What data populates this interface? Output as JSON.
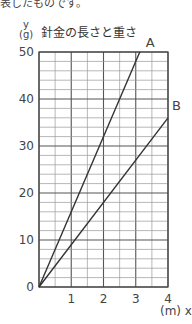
{
  "page": {
    "cut_text": "表したものです。"
  },
  "chart_data": {
    "type": "line",
    "title": "針金の長さと重さ",
    "xlabel": "(m) x",
    "ylabel": "y (g)",
    "ylabel_var": "y",
    "ylabel_unit": "(g)",
    "x_unit": "(m)",
    "x_var": "x",
    "xlim": [
      0,
      4
    ],
    "ylim": [
      0,
      50
    ],
    "x_ticks": [
      "0",
      "1",
      "2",
      "3",
      "4"
    ],
    "y_ticks": [
      "0",
      "10",
      "20",
      "30",
      "40",
      "50"
    ],
    "grid": true,
    "x_minor_step": 0.5,
    "y_minor_step": 2,
    "series": [
      {
        "name": "A",
        "x": [
          0,
          3.125
        ],
        "y": [
          0,
          50
        ],
        "slope": 16
      },
      {
        "name": "B",
        "x": [
          0,
          4
        ],
        "y": [
          0,
          36
        ],
        "slope": 9
      }
    ]
  }
}
